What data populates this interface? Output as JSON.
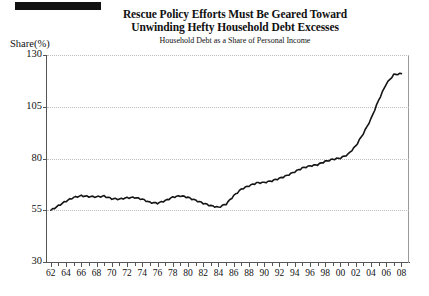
{
  "header": {
    "marker_bar": "black-bar"
  },
  "chart_data": {
    "type": "line",
    "title": "Rescue Policy Efforts Must Be Geared Toward Unwinding Hefty Household Debt Excesses",
    "title_lines": [
      "Rescue Policy Efforts Must Be Geared Toward",
      "Unwinding Hefty Household Debt Excesses"
    ],
    "subtitle": "Household Debt as a Share of Personal Income",
    "ylabel": "Share(%)",
    "xlabel": "",
    "ylim": [
      30,
      130
    ],
    "xlim": [
      1961.5,
      2009
    ],
    "yticks": [
      130,
      105,
      80,
      55,
      30
    ],
    "ytick_labels": [
      "130",
      "105",
      "80",
      "55",
      "30"
    ],
    "grid": true,
    "grid_axis": "y",
    "legend": null,
    "xticks": [
      1962,
      1964,
      1966,
      1968,
      1970,
      1972,
      1974,
      1976,
      1978,
      1980,
      1982,
      1984,
      1986,
      1988,
      1990,
      1992,
      1994,
      1996,
      1998,
      2000,
      2002,
      2004,
      2006,
      2008
    ],
    "xtick_labels": [
      "62",
      "64",
      "66",
      "68",
      "70",
      "72",
      "74",
      "76",
      "78",
      "80",
      "82",
      "84",
      "86",
      "88",
      "90",
      "92",
      "94",
      "96",
      "98",
      "00",
      "02",
      "04",
      "06",
      "08"
    ],
    "minor_xticks_every": 1,
    "line_color": "#151515",
    "series": [
      {
        "name": "Household Debt as a Share of Personal Income",
        "x": [
          1962,
          1963,
          1964,
          1965,
          1966,
          1967,
          1968,
          1969,
          1970,
          1971,
          1972,
          1973,
          1974,
          1975,
          1976,
          1977,
          1978,
          1979,
          1980,
          1981,
          1982,
          1983,
          1984,
          1985,
          1986,
          1987,
          1988,
          1989,
          1990,
          1991,
          1992,
          1993,
          1994,
          1995,
          1996,
          1997,
          1998,
          1999,
          2000,
          2001,
          2002,
          2003,
          2004,
          2005,
          2006,
          2007,
          2008
        ],
        "values": [
          55.0,
          57.2,
          59.4,
          61.2,
          62.0,
          61.6,
          61.5,
          61.8,
          60.6,
          60.4,
          61.0,
          61.2,
          60.3,
          58.8,
          58.4,
          59.6,
          61.3,
          62.0,
          61.2,
          59.8,
          58.4,
          57.2,
          56.4,
          58.0,
          62.0,
          65.2,
          66.8,
          68.2,
          68.4,
          69.2,
          70.4,
          71.8,
          73.6,
          75.4,
          76.4,
          77.0,
          78.6,
          79.6,
          80.2,
          82.0,
          86.0,
          92.0,
          99.0,
          108.0,
          116.0,
          120.5,
          121.0
        ]
      }
    ]
  }
}
